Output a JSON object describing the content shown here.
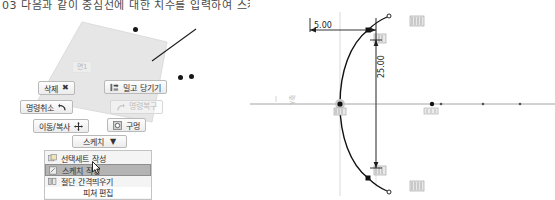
{
  "caption": {
    "text": "03 다음과 같이 중심선에 대한 치수를 입력하여 스케치를 완성합니다."
  },
  "left_viewport": {
    "name": "3d-model-viewport",
    "face_label": "면1",
    "context_toolbar": {
      "buttons": [
        {
          "id": "delete",
          "label": "삭제",
          "icon": "x-mark-icon",
          "enabled": true
        },
        {
          "id": "pushpull",
          "label": "밀고 당기기",
          "icon": "push-pull-icon",
          "enabled": true
        },
        {
          "id": "undo",
          "label": "명령취소",
          "icon": "undo-arrow-icon",
          "enabled": true
        },
        {
          "id": "redo",
          "label": "명령복구",
          "icon": "redo-arrow-icon",
          "enabled": false
        },
        {
          "id": "movecopy",
          "label": "이동/복사",
          "icon": "move-cross-icon",
          "enabled": true
        },
        {
          "id": "hole",
          "label": "구멍",
          "icon": "hole-circle-icon",
          "enabled": true
        }
      ],
      "dropdown": {
        "label": "스케치",
        "caret": "▼"
      }
    },
    "menu": {
      "items": [
        {
          "label": "선택세트 작성",
          "icon": "selection-set-icon",
          "selected": false
        },
        {
          "label": "스케치 작성",
          "icon": "sketch-icon",
          "selected": true
        },
        {
          "label": "절단 간격띄우기",
          "icon": "section-offset-icon",
          "selected": false
        }
      ],
      "footer": "피쳐 편집"
    }
  },
  "right_viewport": {
    "name": "sketch-viewport",
    "axis_tag": "Y축",
    "dimensions": [
      {
        "id": "horizontal-dim",
        "value": "5.00"
      },
      {
        "id": "vertical-dim",
        "value": "25.00"
      }
    ]
  },
  "colors": {
    "geometry": "#111111",
    "reference_axis": "#9a9a9a",
    "face_fill": "#e4e4e4",
    "selection_highlight": "#b4b4b4"
  }
}
